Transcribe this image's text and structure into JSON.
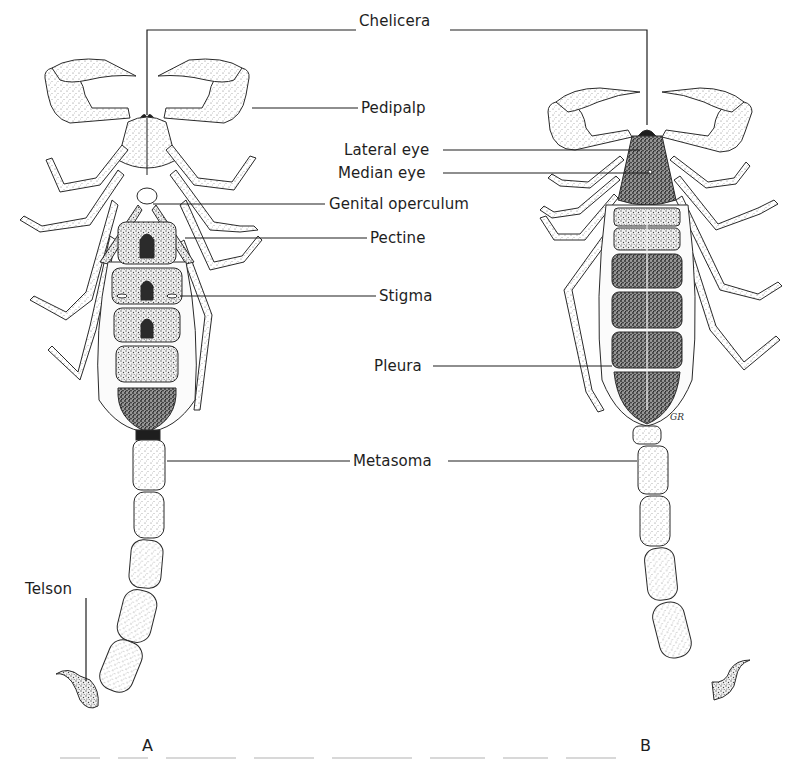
{
  "figure": {
    "type": "anatomical-line-drawing",
    "panels": [
      {
        "id": "A",
        "label": "A",
        "x": 147,
        "y": 737,
        "view": "ventral"
      },
      {
        "id": "B",
        "label": "B",
        "x": 645,
        "y": 737,
        "view": "dorsal"
      }
    ],
    "labels": [
      {
        "id": "chelicera",
        "text": "Chelicera",
        "x": 359,
        "y": 21
      },
      {
        "id": "pedipalp",
        "text": "Pedipalp",
        "x": 361,
        "y": 99
      },
      {
        "id": "lateral-eye",
        "text": "Lateral eye",
        "x": 344,
        "y": 141
      },
      {
        "id": "median-eye",
        "text": "Median eye",
        "x": 338,
        "y": 164
      },
      {
        "id": "genital-operculum",
        "text": "Genital operculum",
        "x": 329,
        "y": 195
      },
      {
        "id": "pectine",
        "text": "Pectine",
        "x": 370,
        "y": 229
      },
      {
        "id": "stigma",
        "text": "Stigma",
        "x": 379,
        "y": 287
      },
      {
        "id": "pleura",
        "text": "Pleura",
        "x": 374,
        "y": 357
      },
      {
        "id": "metasoma",
        "text": "Metasoma",
        "x": 353,
        "y": 452
      },
      {
        "id": "telson",
        "text": "Telson",
        "x": 39,
        "y": 580
      }
    ],
    "leader_lines": [
      {
        "for": "chelicera",
        "points": [
          [
            147,
            115
          ],
          [
            147,
            30
          ],
          [
            356,
            30
          ]
        ]
      },
      {
        "for": "chelicera",
        "points": [
          [
            450,
            30
          ],
          [
            647,
            30
          ],
          [
            647,
            125
          ]
        ]
      },
      {
        "for": "pedipalp",
        "points": [
          [
            252,
            108
          ],
          [
            358,
            108
          ]
        ]
      },
      {
        "for": "lateral-eye",
        "points": [
          [
            443,
            150
          ],
          [
            640,
            150
          ]
        ]
      },
      {
        "for": "median-eye",
        "points": [
          [
            443,
            173
          ],
          [
            650,
            173
          ]
        ]
      },
      {
        "for": "genital-operculum",
        "points": [
          [
            153,
            204
          ],
          [
            325,
            204
          ]
        ]
      },
      {
        "for": "pectine",
        "points": [
          [
            185,
            238
          ],
          [
            367,
            238
          ]
        ]
      },
      {
        "for": "stigma",
        "points": [
          [
            180,
            296
          ],
          [
            376,
            296
          ]
        ]
      },
      {
        "for": "pleura",
        "points": [
          [
            433,
            366
          ],
          [
            612,
            366
          ]
        ]
      },
      {
        "for": "metasoma",
        "points": [
          [
            167,
            461
          ],
          [
            350,
            461
          ]
        ]
      },
      {
        "for": "metasoma",
        "points": [
          [
            448,
            461
          ],
          [
            637,
            461
          ]
        ]
      },
      {
        "for": "telson",
        "points": [
          [
            86,
            598
          ],
          [
            86,
            681
          ]
        ]
      }
    ],
    "colors": {
      "ink": "#1e1e1e",
      "paper": "#ffffff",
      "stipple_dark": "#3a3a3a",
      "stipple_light": "#bdbdbd"
    }
  }
}
